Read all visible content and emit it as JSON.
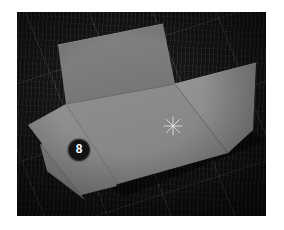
{
  "scene": {
    "title": "Flattened cardboard box on dark fabric mat",
    "background_color": "#121212",
    "mat_color": "#161616",
    "grid_line_color": "#bebebe"
  },
  "overlays": {
    "step_badge": {
      "label": "8",
      "icon": "numbered-step-badge",
      "background_color": "#111214",
      "text_color": "#ffffff",
      "position": {
        "x": 61,
        "y": 137
      }
    },
    "center_marker": {
      "icon": "sparkle-marker-icon",
      "color": "#d8d8d8",
      "position": {
        "x": 156,
        "y": 114
      }
    }
  },
  "box": {
    "material_color": "#868686",
    "panels": [
      {
        "name": "back-wall-panel",
        "role": "upright back wall",
        "fill": "#7d7d7d",
        "points": "41,33 146,12 158,72 49,92"
      },
      {
        "name": "right-side-panel",
        "role": "upright right wall",
        "fill": "#8e8e8e",
        "points": "158,72 239,51 236,118 211,141"
      },
      {
        "name": "base-panel",
        "role": "box floor",
        "fill": "#8a8a8a",
        "points": "49,92 158,72 211,141 101,172"
      },
      {
        "name": "left-flap-upper",
        "role": "left folded flap upper",
        "fill": "#8c8c8c",
        "points": "11,113 49,92 101,172 63,183"
      },
      {
        "name": "left-flap-lower",
        "role": "left folded flap lower",
        "fill": "#848484",
        "points": "23,132 63,183 66,186 31,160"
      }
    ],
    "creases": [
      {
        "name": "crease-back-to-base",
        "points": "49,92 158,72"
      },
      {
        "name": "crease-base-to-right",
        "points": "158,72 211,141"
      },
      {
        "name": "crease-base-to-left-flap",
        "points": "49,92 101,172"
      },
      {
        "name": "crease-left-flap-fold",
        "points": "23,132 66,186"
      }
    ]
  }
}
